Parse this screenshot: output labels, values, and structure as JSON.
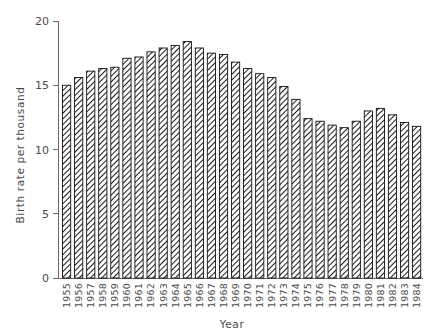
{
  "chart_data": {
    "type": "bar",
    "title": "",
    "subtitle": "",
    "xlabel": "Year",
    "ylabel": "Birth rate per thousand",
    "xlim": [
      0,
      30
    ],
    "ylim": [
      0,
      20
    ],
    "yticks": [
      0,
      5,
      10,
      15,
      20
    ],
    "ytick_labels": [
      "0",
      "5",
      "10",
      "15",
      "20"
    ],
    "grid": false,
    "legend": null,
    "legend_position": "none",
    "bar_style": {
      "fill": "diagonal-hatch",
      "edge_color": "#111111",
      "face_color": "#ffffff",
      "hatch_color": "#1a1a1a"
    },
    "categories": [
      "1955",
      "1956",
      "1957",
      "1958",
      "1959",
      "1960",
      "1961",
      "1962",
      "1963",
      "1964",
      "1965",
      "1966",
      "1967",
      "1968",
      "1969",
      "1970",
      "1971",
      "1972",
      "1973",
      "1974",
      "1975",
      "1976",
      "1977",
      "1978",
      "1979",
      "1980",
      "1981",
      "1982",
      "1983",
      "1984"
    ],
    "values": [
      15.0,
      15.6,
      16.1,
      16.3,
      16.4,
      17.1,
      17.2,
      17.6,
      17.9,
      18.1,
      18.4,
      17.9,
      17.5,
      17.4,
      16.8,
      16.3,
      15.9,
      15.6,
      14.9,
      13.9,
      12.4,
      12.2,
      11.9,
      11.7,
      12.2,
      13.0,
      13.2,
      12.7,
      12.1,
      11.8
    ],
    "annotations": []
  },
  "axes": {
    "y_title": "Birth rate per thousand",
    "x_title": "Year"
  },
  "colors": {
    "axis": "#6a6a6a",
    "text": "#4a4a4a",
    "bar_edge": "#111111",
    "background": "#ffffff"
  }
}
